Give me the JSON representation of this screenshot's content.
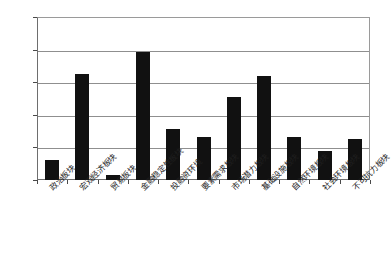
{
  "chart_data": {
    "type": "bar",
    "title": "",
    "subtitle": "",
    "xlabel": "",
    "ylabel": "",
    "ylim": [
      0,
      0.25
    ],
    "yticks": [
      "0",
      "0.05",
      "0.1",
      "0.15",
      "0.2",
      "0.25"
    ],
    "ytick_values": [
      0,
      0.05,
      0.1,
      0.15,
      0.2,
      0.25
    ],
    "grid": "horizontal",
    "legend": "none",
    "bar_color": "#111111",
    "gridline_color": "#8f8f8f",
    "axis_color": "#6e6e6e",
    "categories": [
      "政治板块",
      "宏观经济板块",
      "贸易板块",
      "金融稳定性板块",
      "投融资环境",
      "要素需求板块",
      "市场潜力板块",
      "基础设施板块",
      "自然环境板块",
      "社会环境板块",
      "不可抗力板块"
    ],
    "values": [
      0.031,
      0.163,
      0.007,
      0.196,
      0.079,
      0.066,
      0.128,
      0.159,
      0.066,
      0.044,
      0.063
    ]
  },
  "caption": {
    "text": ""
  }
}
